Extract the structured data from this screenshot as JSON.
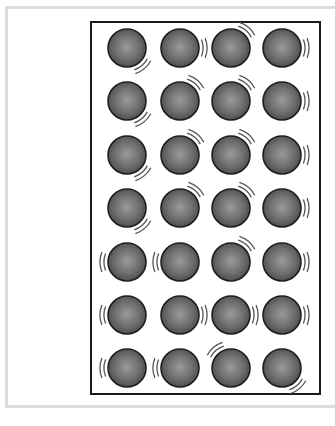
{
  "diagram": {
    "title": "",
    "colors": {
      "frame": "#dcdcdc",
      "box_border": "#1a1a1a",
      "particle_center": "#9a9a9a",
      "particle_edge": "#4a4a4a",
      "particle_outline": "#1e1e1e",
      "vibration_mark": "#555555"
    },
    "grid": {
      "rows": 7,
      "cols": 4,
      "radius": 19,
      "col_x": [
        127,
        180,
        231,
        282
      ],
      "row_y": [
        48,
        101,
        155,
        208,
        262,
        315,
        368
      ]
    },
    "particles": [
      [
        "lower-right",
        "right",
        "upper-right",
        "right"
      ],
      [
        "lower-right",
        "upper-right",
        "upper-right",
        "right"
      ],
      [
        "lower-right",
        "upper-right",
        "upper-right",
        "right"
      ],
      [
        "lower-right",
        "upper-right",
        "upper-right",
        "right"
      ],
      [
        "left",
        "left",
        "upper-right",
        "right"
      ],
      [
        "left",
        "right",
        "right",
        "right"
      ],
      [
        "left",
        "left",
        "upper-left",
        "lower-right"
      ]
    ]
  }
}
